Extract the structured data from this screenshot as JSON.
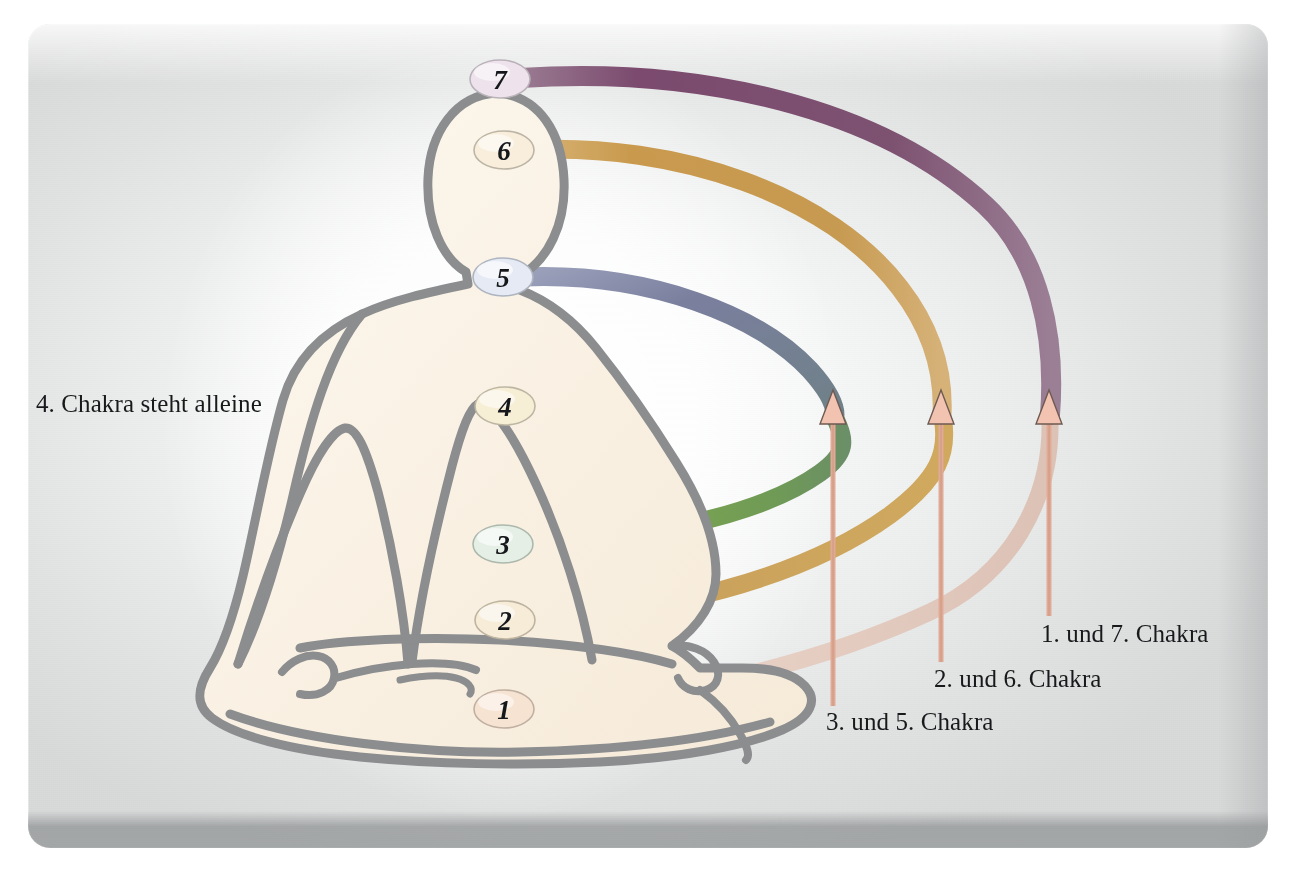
{
  "diagram": {
    "figure_name": "meditating-figure-lotus-position",
    "background": {
      "panel_color": "#eceded",
      "page_color": "#ffffff",
      "body_fill": "#faf2e6",
      "body_outline": "#8b8d8f"
    },
    "chakras": [
      {
        "id": 1,
        "label": "1",
        "badge_fill": "#f6e3d2",
        "band_color": "#e7cfc3",
        "paired_with": 7,
        "stands_alone": false
      },
      {
        "id": 2,
        "label": "2",
        "badge_fill": "#f6ecd8",
        "band_color": "#c9a05a",
        "paired_with": 6,
        "stands_alone": false
      },
      {
        "id": 3,
        "label": "3",
        "badge_fill": "#e6efe6",
        "band_color": "#7fa84e",
        "paired_with": 5,
        "stands_alone": false
      },
      {
        "id": 4,
        "label": "4",
        "badge_fill": "#f7eed6",
        "band_color": "none",
        "paired_with": null,
        "stands_alone": true
      },
      {
        "id": 5,
        "label": "5",
        "badge_fill": "#e5eaf4",
        "band_color": "#7a7f9e",
        "paired_with": 3,
        "stands_alone": false
      },
      {
        "id": 6,
        "label": "6",
        "badge_fill": "#f8eedb",
        "band_color": "#c99a4e",
        "paired_with": 2,
        "stands_alone": false
      },
      {
        "id": 7,
        "label": "7",
        "badge_fill": "#eee3ec",
        "band_color": "#7b4a6e",
        "paired_with": 1,
        "stands_alone": false
      }
    ],
    "annotations": {
      "alone_note": "4. Chakra steht alleine",
      "pair_labels": [
        {
          "text": "3. und 5. Chakra",
          "arrow_color": "#e0ab96"
        },
        {
          "text": "2. und 6. Chakra",
          "arrow_color": "#e0ab96"
        },
        {
          "text": "1. und 7. Chakra",
          "arrow_color": "#e0ab96"
        }
      ]
    }
  }
}
